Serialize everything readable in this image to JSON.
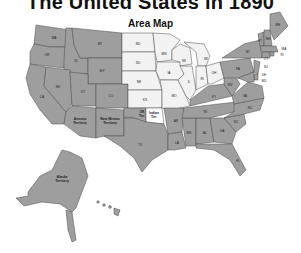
{
  "title": "The United States in 1890",
  "subtitle": "Area Map",
  "colors": {
    "state": "#9e9e9e",
    "territory": "#9e9e9e",
    "plains": "#f2f2f2",
    "indian_territory": "#ffffff",
    "border": "#4a4a4a",
    "background": "#ffffff"
  },
  "regions": {
    "WA": "WA",
    "OR": "OR",
    "CA": "CA",
    "ID": "ID",
    "NV": "NV",
    "MT": "MT",
    "WY": "WY",
    "UT": "UT",
    "CO": "CO",
    "AZ": "Arizona Territory",
    "NM": "New Mexico Territory",
    "ND": "ND",
    "SD": "SD",
    "NE": "NE",
    "KS": "KS",
    "MN": "MN",
    "IA": "IA",
    "MO": "MO",
    "WI": "WI",
    "IL": "IL",
    "MI": "MI",
    "IN": "IN",
    "OH": "OH",
    "OK": "OK Ter.",
    "IT": "Indian Ter.",
    "TX": "TX",
    "AR": "AR",
    "LA": "LA",
    "MS": "MS",
    "AL": "AL",
    "GA": "GA",
    "FL": "FL",
    "TN": "TN",
    "KY": "KY",
    "SC": "SC",
    "NC": "NC",
    "VA": "VA",
    "WV": "WV",
    "PA": "PA",
    "NY": "NY",
    "VT": "VT",
    "NH": "NH",
    "ME": "ME",
    "MA": "MA",
    "RI": "RI",
    "CT": "CT",
    "NJ": "NJ",
    "DE": "DE",
    "MD": "MD",
    "AK": "Alaska Territory",
    "HI": "HI"
  }
}
